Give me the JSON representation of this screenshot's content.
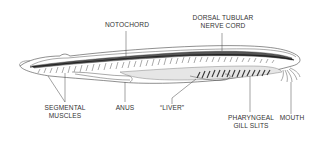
{
  "diagram": {
    "colors": {
      "background": "#ffffff",
      "ink": "#333333",
      "fill_dark": "#555555",
      "fill_light": "#dddddd"
    },
    "labels": {
      "notochord": "NOTOCHORD",
      "dorsal_nerve_cord_line1": "DORSAL TUBULAR",
      "dorsal_nerve_cord_line2": "NERVE CORD",
      "segmental_muscles_line1": "SEGMENTAL",
      "segmental_muscles_line2": "MUSCLES",
      "anus": "ANUS",
      "liver": "“LIVER”",
      "pharyngeal_gill_slits_line1": "PHARYNGEAL",
      "pharyngeal_gill_slits_line2": "GILL SLITS",
      "mouth": "MOUTH"
    }
  }
}
